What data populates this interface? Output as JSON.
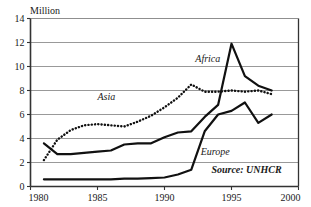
{
  "chart_data": {
    "type": "line",
    "title": "",
    "unit_label": "Million",
    "xlabel": "",
    "ylabel": "",
    "xlim": [
      1980,
      2000
    ],
    "ylim": [
      0,
      14
    ],
    "x_ticks": [
      1980,
      1985,
      1990,
      1995,
      2000
    ],
    "y_ticks": [
      0,
      2,
      4,
      6,
      8,
      10,
      12,
      14
    ],
    "grid": "horizontal",
    "legend_position": "inline-annotations",
    "source": "Source: UNHCR",
    "series": [
      {
        "name": "Africa",
        "style": "solid",
        "color": "#111111",
        "x": [
          1981,
          1982,
          1983,
          1984,
          1985,
          1986,
          1987,
          1988,
          1989,
          1990,
          1991,
          1992,
          1993,
          1994,
          1995,
          1996,
          1997,
          1998
        ],
        "values": [
          3.6,
          2.7,
          2.7,
          2.8,
          2.9,
          3.0,
          3.5,
          3.6,
          3.6,
          4.1,
          4.5,
          4.6,
          5.8,
          6.8,
          11.9,
          9.2,
          8.4,
          8.0
        ]
      },
      {
        "name": "Asia",
        "style": "dotted",
        "color": "#111111",
        "x": [
          1981,
          1982,
          1983,
          1984,
          1985,
          1986,
          1987,
          1988,
          1989,
          1990,
          1991,
          1992,
          1993,
          1994,
          1995,
          1996,
          1997,
          1998
        ],
        "values": [
          2.2,
          3.9,
          4.7,
          5.1,
          5.2,
          5.1,
          5.0,
          5.4,
          5.9,
          6.6,
          7.4,
          8.5,
          7.9,
          7.9,
          8.0,
          7.9,
          8.0,
          7.7
        ]
      },
      {
        "name": "Europe",
        "style": "solid",
        "color": "#111111",
        "x": [
          1981,
          1982,
          1983,
          1984,
          1985,
          1986,
          1987,
          1988,
          1989,
          1990,
          1991,
          1992,
          1993,
          1994,
          1995,
          1996,
          1997,
          1998
        ],
        "values": [
          0.6,
          0.6,
          0.6,
          0.6,
          0.6,
          0.6,
          0.65,
          0.65,
          0.7,
          0.75,
          1.0,
          1.4,
          4.6,
          6.0,
          6.3,
          7.0,
          5.3,
          6.0
        ]
      }
    ],
    "annotations": [
      {
        "text": "Africa",
        "x": 1992.3,
        "y": 10.4
      },
      {
        "text": "Asia",
        "x": 1985.0,
        "y": 7.2
      },
      {
        "text": "Europe",
        "x": 1992.7,
        "y": 2.6
      },
      {
        "text": "Source: UNHCR",
        "x": 1993.5,
        "y": 1.1
      }
    ]
  }
}
